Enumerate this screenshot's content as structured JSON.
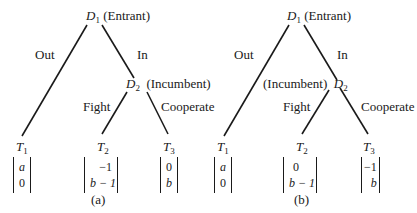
{
  "panels": [
    {
      "caption": "(a)",
      "root": {
        "symbol": "D",
        "sub": "1",
        "role": "(Entrant)"
      },
      "incumbent": {
        "symbol": "D",
        "sub": "2",
        "role": "(Incumbent)",
        "role_side": "right"
      },
      "edges": {
        "out": "Out",
        "in": "In",
        "fight": "Fight",
        "cooperate": "Cooperate"
      },
      "terminals": [
        {
          "symbol": "T",
          "sub": "1",
          "payoff": [
            "a",
            "0"
          ]
        },
        {
          "symbol": "T",
          "sub": "2",
          "payoff": [
            "−1",
            "b − 1"
          ]
        },
        {
          "symbol": "T",
          "sub": "3",
          "payoff": [
            "0",
            "b"
          ]
        }
      ]
    },
    {
      "caption": "(b)",
      "root": {
        "symbol": "D",
        "sub": "1",
        "role": "(Entrant)"
      },
      "incumbent": {
        "symbol": "D",
        "sub": "2",
        "role": "(Incumbent)",
        "role_side": "left"
      },
      "edges": {
        "out": "Out",
        "in": "In",
        "fight": "Fight",
        "cooperate": "Cooperate"
      },
      "terminals": [
        {
          "symbol": "T",
          "sub": "1",
          "payoff": [
            "a",
            "0"
          ]
        },
        {
          "symbol": "T",
          "sub": "2",
          "payoff": [
            "0",
            "b − 1"
          ]
        },
        {
          "symbol": "T",
          "sub": "3",
          "payoff": [
            "−1",
            "b"
          ]
        }
      ]
    }
  ]
}
